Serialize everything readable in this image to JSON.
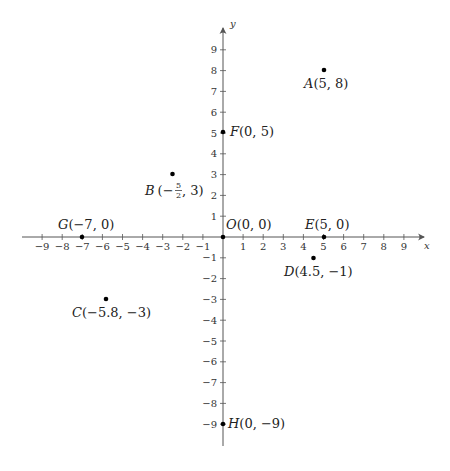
{
  "chart_data": {
    "type": "scatter",
    "title": "",
    "xlabel": "x",
    "ylabel": "y",
    "xlim": [
      -9,
      9
    ],
    "ylim": [
      -9,
      9
    ],
    "grid": false,
    "x_ticks": [
      -9,
      -8,
      -7,
      -6,
      -5,
      -4,
      -3,
      -2,
      -1,
      1,
      2,
      3,
      4,
      5,
      6,
      7,
      8,
      9
    ],
    "y_ticks": [
      -9,
      -8,
      -7,
      -6,
      -5,
      -4,
      -3,
      -2,
      -1,
      1,
      2,
      3,
      4,
      5,
      6,
      7,
      8,
      9
    ],
    "points": [
      {
        "name": "A",
        "x": 5,
        "y": 8,
        "label": "A(5, 8)",
        "label_pos": "below"
      },
      {
        "name": "B",
        "x": -2.5,
        "y": 3,
        "label": "B(−5/2, 3)",
        "label_pos": "below-left"
      },
      {
        "name": "C",
        "x": -5.8,
        "y": -3,
        "label": "C(−5.8, −3)",
        "label_pos": "below"
      },
      {
        "name": "D",
        "x": 4.5,
        "y": -1,
        "label": "D(4.5, −1)",
        "label_pos": "below"
      },
      {
        "name": "E",
        "x": 5,
        "y": 0,
        "label": "E(5, 0)",
        "label_pos": "above"
      },
      {
        "name": "F",
        "x": 0,
        "y": 5,
        "label": "F(0, 5)",
        "label_pos": "right"
      },
      {
        "name": "G",
        "x": -7,
        "y": 0,
        "label": "G(−7, 0)",
        "label_pos": "above"
      },
      {
        "name": "H",
        "x": 0,
        "y": -9,
        "label": "H(0, −9)",
        "label_pos": "right"
      },
      {
        "name": "O",
        "x": 0,
        "y": 0,
        "label": "O(0, 0)",
        "label_pos": "above-right"
      }
    ]
  },
  "axes": {
    "x_label": "x",
    "y_label": "y"
  },
  "labels": {
    "A": {
      "letter": "A",
      "coords": "(5, 8)"
    },
    "B": {
      "letter": "B",
      "open": "(−",
      "num": "5",
      "den": "2",
      "close": ", 3)"
    },
    "C": {
      "letter": "C",
      "coords": "(−5.8, −3)"
    },
    "D": {
      "letter": "D",
      "coords": "(4.5, −1)"
    },
    "E": {
      "letter": "E",
      "coords": "(5, 0)"
    },
    "F": {
      "letter": "F",
      "coords": "(0, 5)"
    },
    "G": {
      "letter": "G",
      "coords": "(−7, 0)"
    },
    "H": {
      "letter": "H",
      "coords": "(0, −9)"
    },
    "O": {
      "letter": "O",
      "coords": "(0, 0)"
    }
  },
  "tick_labels": {
    "x": [
      "−9",
      "−8",
      "−7",
      "−6",
      "−5",
      "−4",
      "−3",
      "−2",
      "−1",
      "1",
      "2",
      "3",
      "4",
      "5",
      "6",
      "7",
      "8",
      "9"
    ],
    "y": [
      "9",
      "8",
      "7",
      "6",
      "5",
      "4",
      "3",
      "2",
      "1",
      "−1",
      "−2",
      "−3",
      "−4",
      "−5",
      "−6",
      "−7",
      "−8",
      "−9"
    ]
  }
}
